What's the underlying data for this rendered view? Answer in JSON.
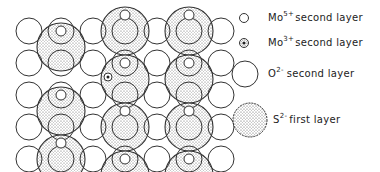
{
  "diagram": {
    "grid": {
      "columns": 7,
      "rows": 5,
      "origin_x": 29,
      "origin_y": 31,
      "spacing": 32,
      "o_radius": 13,
      "s_radius": 24,
      "mo5_radius": 5,
      "mo3_radius": 4
    },
    "sulfur_sites": [
      {
        "col": 1,
        "row": 0.5
      },
      {
        "col": 3,
        "row": 0
      },
      {
        "col": 3,
        "row": 1.5
      },
      {
        "col": 5,
        "row": 0
      },
      {
        "col": 5,
        "row": 1.5
      },
      {
        "col": 1,
        "row": 2.5
      },
      {
        "col": 3,
        "row": 3
      },
      {
        "col": 5,
        "row": 3
      },
      {
        "col": 1,
        "row": 4
      },
      {
        "col": 3,
        "row": 4.5
      },
      {
        "col": 5,
        "row": 4.5
      }
    ],
    "mo3_sites": [
      {
        "x": 108,
        "y": 77
      }
    ],
    "colors": {
      "stroke": "#333333",
      "stipple": "#555555",
      "background": "#ffffff"
    }
  },
  "legend": {
    "items": [
      {
        "symbol": "mo5-small-open-circle",
        "ion": "Mo",
        "charge": "5+",
        "label": "second layer"
      },
      {
        "symbol": "mo3-small-dotted-circle",
        "ion": "Mo",
        "charge": "3+",
        "label": "second layer"
      },
      {
        "symbol": "o2-large-open-circle",
        "ion": "O",
        "charge": "2-",
        "label": "second layer"
      },
      {
        "symbol": "s2-stippled-circle",
        "ion": "S",
        "charge": "2-",
        "label": "first layer"
      }
    ]
  }
}
